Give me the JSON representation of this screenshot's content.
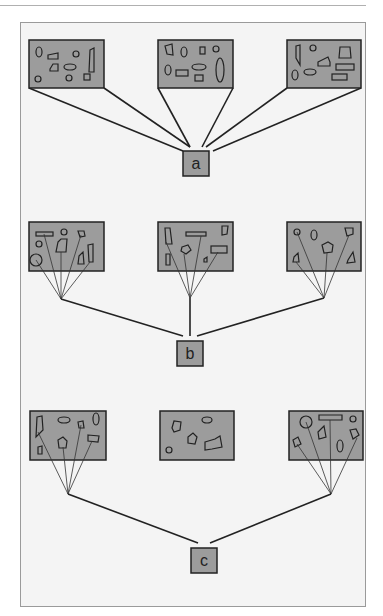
{
  "groups": [
    {
      "label": "a",
      "panels": 3,
      "description": "three panels each fully connected to label a"
    },
    {
      "label": "b",
      "panels": 3,
      "description": "selected objects in each panel converge to a point, joined to label b"
    },
    {
      "label": "c",
      "panels": 3,
      "description": "selected objects in outer panels converge, joined to label c; middle panel unconnected"
    }
  ],
  "colors": {
    "panel_fill": "#9c9c9c",
    "stroke": "#222222",
    "background": "#f4f4f4"
  }
}
